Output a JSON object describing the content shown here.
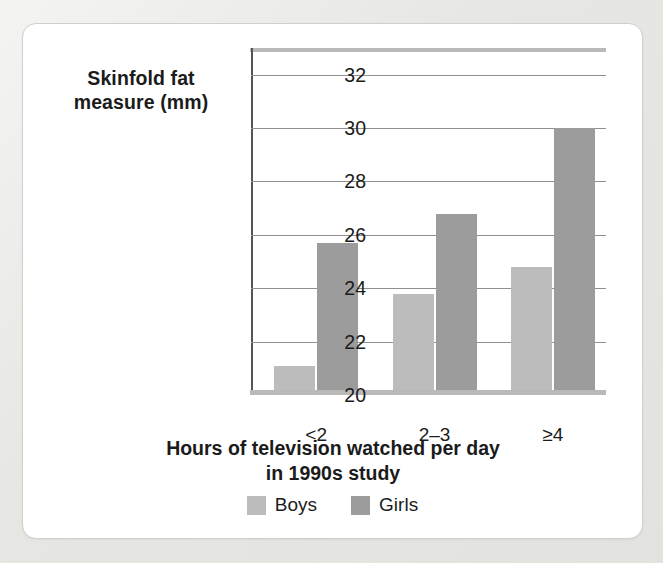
{
  "chart_data": {
    "type": "bar",
    "title": "",
    "xlabel": "Hours of television watched per day in 1990s study",
    "ylabel": "Skinfold fat measure (mm)",
    "categories": [
      "<2",
      "2–3",
      "≥4"
    ],
    "series": [
      {
        "name": "Boys",
        "color": "#bcbcbc",
        "values": [
          21.1,
          23.8,
          24.8
        ]
      },
      {
        "name": "Girls",
        "color": "#9c9c9c",
        "values": [
          25.7,
          26.8,
          30.0
        ]
      }
    ],
    "ylim": [
      20,
      33
    ],
    "yticks": [
      20,
      22,
      24,
      26,
      28,
      30,
      32
    ],
    "ytick_labels": [
      "20",
      "22",
      "24",
      "26",
      "28",
      "30",
      "32"
    ],
    "grid": true,
    "legend_position": "bottom"
  },
  "axes": {
    "y_title": "Skinfold fat measure (mm)",
    "y_title_line1": "Skinfold fat",
    "y_title_line2": "measure (mm)",
    "x_title_line1": "Hours of television watched per day",
    "x_title_line2": "in 1990s study"
  },
  "legend": {
    "items": [
      {
        "label": "Boys",
        "color": "#bcbcbc"
      },
      {
        "label": "Girls",
        "color": "#9c9c9c"
      }
    ]
  },
  "colors": {
    "boys": "#bcbcbc",
    "girls": "#9c9c9c",
    "gridline": "#8f8f8f",
    "axis": "#b9b9b9",
    "text": "#1b1b1b",
    "card_background": "#ffffff",
    "page_background": "#e6e6e3"
  }
}
